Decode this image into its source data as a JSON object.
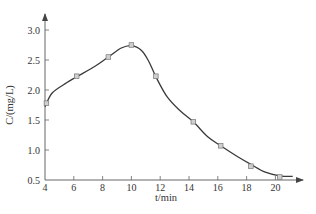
{
  "chart_data": {
    "type": "line",
    "title": "",
    "xlabel": "t/min",
    "ylabel": "C/(mg/L)",
    "xlim": [
      4,
      21.5
    ],
    "ylim": [
      0.5,
      3.2
    ],
    "x_ticks": [
      4,
      6,
      8,
      10,
      12,
      14,
      16,
      18,
      20
    ],
    "x_tick_labels": [
      "4",
      "6",
      "8",
      "10",
      "12",
      "14",
      "16",
      "18",
      "20"
    ],
    "y_ticks": [
      0.5,
      1.0,
      1.5,
      2.0,
      2.5,
      3.0
    ],
    "y_tick_labels": [
      "0.5",
      "1.0",
      "1.5",
      "2.0",
      "2.5",
      "3.0"
    ],
    "grid": false,
    "legend": null,
    "series": [
      {
        "name": "measured",
        "marker": "square",
        "x": [
          4.1,
          6.2,
          8.4,
          10.0,
          11.7,
          14.3,
          16.2,
          18.3,
          20.3
        ],
        "values": [
          1.78,
          2.23,
          2.55,
          2.75,
          2.23,
          1.47,
          1.07,
          0.73,
          0.55
        ]
      }
    ],
    "fit_curve": {
      "x": [
        4.0,
        4.5,
        5.5,
        6.2,
        7.5,
        8.4,
        9.3,
        10.0,
        10.7,
        11.2,
        11.7,
        12.5,
        13.4,
        14.3,
        15.3,
        16.2,
        17.3,
        18.3,
        19.3,
        20.3,
        21.2
      ],
      "values": [
        1.72,
        1.95,
        2.12,
        2.22,
        2.4,
        2.55,
        2.7,
        2.74,
        2.66,
        2.48,
        2.22,
        1.88,
        1.65,
        1.47,
        1.22,
        1.07,
        0.9,
        0.76,
        0.63,
        0.57,
        0.56
      ]
    }
  }
}
